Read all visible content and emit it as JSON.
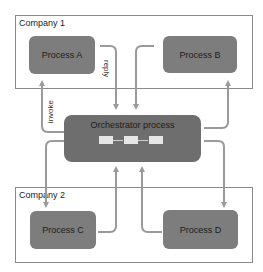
{
  "companies": [
    {
      "label": "Company 1"
    },
    {
      "label": "Company 2"
    }
  ],
  "processes": {
    "a": "Process A",
    "b": "Process B",
    "c": "Process C",
    "d": "Process D"
  },
  "orchestrator": {
    "title": "Orchestrator process",
    "steps": 3
  },
  "labels": {
    "reply": "reply",
    "invoke": "invoke"
  },
  "colors": {
    "process_fill": "#7d7d7d",
    "orchestrator_fill": "#6e6e6e",
    "arrow": "#9a9a9a",
    "border": "#8a8a8a"
  }
}
